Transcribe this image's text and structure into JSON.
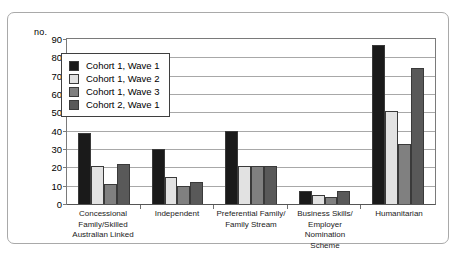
{
  "axis_unit_label": "no.",
  "colors": {
    "series1": "#1a1a1a",
    "series2": "#e2e2e2",
    "series3": "#808080",
    "series4": "#595959",
    "bar_outline": "#3a3a3a",
    "gridline": "#a8a8a8",
    "frame_border": "#a9a9a9",
    "axis": "#7a7a7a"
  },
  "legend": {
    "items": [
      {
        "label": "Cohort 1, Wave 1",
        "color": "#1a1a1a"
      },
      {
        "label": "Cohort 1, Wave 2",
        "color": "#e2e2e2"
      },
      {
        "label": "Cohort 1, Wave 3",
        "color": "#808080"
      },
      {
        "label": "Cohort 2, Wave 1",
        "color": "#595959"
      }
    ]
  },
  "chart_data": {
    "type": "bar",
    "title": "",
    "xlabel": "",
    "ylabel": "no.",
    "ylim": [
      0,
      90
    ],
    "yticks": [
      0,
      10,
      20,
      30,
      40,
      50,
      60,
      70,
      80,
      90
    ],
    "ytick_labels": [
      "0",
      "10",
      "20",
      "30",
      "40",
      "50",
      "60",
      "70",
      "80",
      "90"
    ],
    "grid": true,
    "legend_position": "upper-left-inside",
    "categories": [
      "Concessional Family/Skilled Australian Linked",
      "Independent",
      "Preferential Family/ Family Stream",
      "Business Skills/ Employer Nomination Scheme",
      "Humanitarian"
    ],
    "category_lines": [
      [
        "Concessional",
        "Family/Skilled",
        "Australian Linked"
      ],
      [
        "Independent"
      ],
      [
        "Preferential Family/",
        "Family Stream"
      ],
      [
        "Business Skills/",
        "Employer Nomination",
        "Scheme"
      ],
      [
        "Humanitarian"
      ]
    ],
    "series": [
      {
        "name": "Cohort 1, Wave 1",
        "color": "#1a1a1a",
        "values": [
          39,
          30,
          40,
          7,
          87
        ]
      },
      {
        "name": "Cohort 1, Wave 2",
        "color": "#e2e2e2",
        "values": [
          21,
          15,
          21,
          5,
          51
        ]
      },
      {
        "name": "Cohort 1, Wave 3",
        "color": "#808080",
        "values": [
          11,
          10,
          21,
          4,
          33
        ]
      },
      {
        "name": "Cohort 2, Wave 1",
        "color": "#595959",
        "values": [
          22,
          12,
          21,
          7,
          74
        ]
      }
    ]
  }
}
